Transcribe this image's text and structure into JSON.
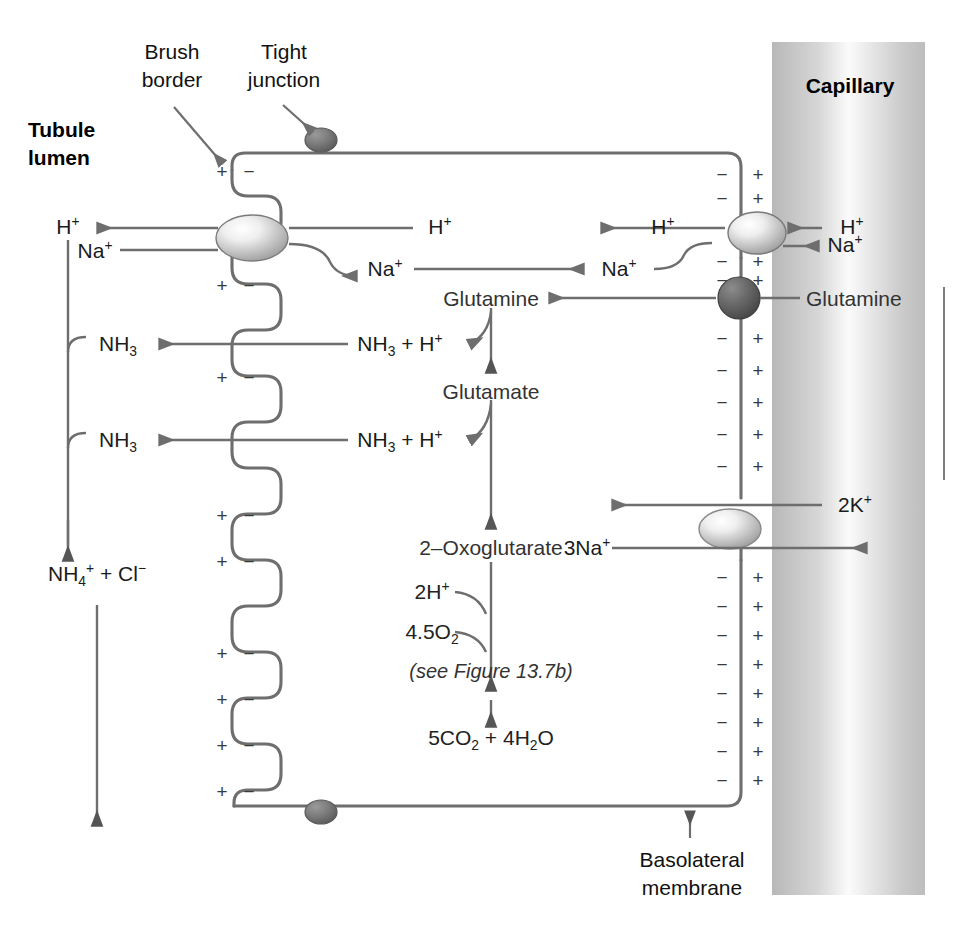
{
  "figure": {
    "title_region": "Renal tubular cell ammoniagenesis and acid secretion",
    "background_color": "#ffffff",
    "line_color": "#6e6e6e",
    "text_color": "#1b1b1b"
  },
  "labels": {
    "brush_border": "Brush\nborder",
    "brush_border_l1": "Brush",
    "brush_border_l2": "border",
    "tight_junction_l1": "Tight",
    "tight_junction_l2": "junction",
    "tubule_lumen_l1": "Tubule",
    "tubule_lumen_l2": "lumen",
    "capillary": "Capillary",
    "basolateral_l1": "Basolateral",
    "basolateral_l2": "membrane"
  },
  "species": {
    "h_lumen": "H+",
    "na_lumen": "Na+",
    "h_cell_mid": "H+",
    "na_cell_mid": "Na+",
    "h_cell_right": "H+",
    "na_cell_right": "Na+",
    "h_capillary": "H+",
    "na_capillary": "Na+",
    "nh3_upper": "NH3",
    "nh3_lower": "NH3",
    "nh3_h_upper": "NH3 + H+",
    "nh3_h_lower": "NH3 + H+",
    "nh4_cl": "NH4+ + Cl-",
    "glutamine_cell": "Glutamine",
    "glutamine_blood": "Glutamine",
    "glutamate": "Glutamate",
    "oxoglutarate": "2–Oxoglutarate",
    "two_h": "2H+",
    "o2": "4.5O2",
    "see_figure": "(see Figure 13.7b)",
    "products": "5CO2 + 4H2O",
    "k_capillary": "2K+",
    "na_pump": "3Na+"
  },
  "charges": {
    "plus": "+",
    "minus": "−",
    "brush_border_pairs": 10,
    "basolateral_pairs_top": 2,
    "basolateral_pairs_mid": 2,
    "basolateral_pairs_upper_block": 5,
    "basolateral_pairs_lower_block": 8
  },
  "transporters": [
    {
      "name": "na-h-exchanger-apical",
      "kind": "ellipse-light"
    },
    {
      "name": "tight-junction-top",
      "kind": "ellipse-dark"
    },
    {
      "name": "tight-junction-bottom",
      "kind": "ellipse-dark"
    },
    {
      "name": "na-h-exchanger-basolateral",
      "kind": "ellipse-light"
    },
    {
      "name": "glutamine-transporter",
      "kind": "circle-dark"
    },
    {
      "name": "na-k-atpase",
      "kind": "ellipse-light"
    }
  ]
}
